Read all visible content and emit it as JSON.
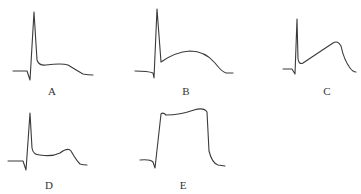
{
  "panels": [
    {
      "label": "A",
      "shape": "spike with low plateau, slow decay"
    },
    {
      "label": "B",
      "shape": "spike followed by broad rounded dome"
    },
    {
      "label": "C",
      "shape": "spike then rising ramp to late peak, rapid fall"
    },
    {
      "label": "D",
      "shape": "spike, low flat plateau, late small hump"
    },
    {
      "label": "E",
      "shape": "rapid upstroke to long flat plateau, rapid repolarization"
    }
  ],
  "colors": {
    "trace": "#3a3a3a",
    "background": "#ffffff"
  }
}
